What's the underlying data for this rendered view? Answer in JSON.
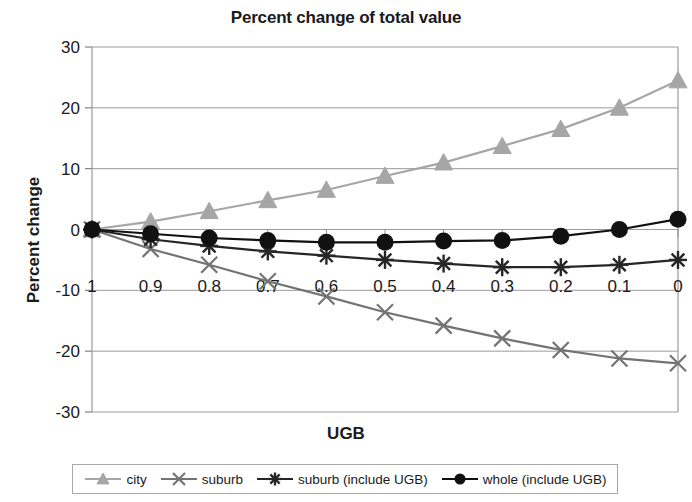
{
  "chart_data": {
    "type": "line",
    "title": "Percent change of total value",
    "xlabel": "UGB",
    "ylabel": "Percent change",
    "x": [
      1,
      0.9,
      0.8,
      0.7,
      0.6,
      0.5,
      0.4,
      0.3,
      0.2,
      0.1,
      0
    ],
    "xticklabels": [
      "1",
      "0.9",
      "0.8",
      "0.7",
      "0.6",
      "0.5",
      "0.4",
      "0.3",
      "0.2",
      "0.1",
      "0"
    ],
    "yticklabels": [
      "30",
      "20",
      "10",
      "0",
      "-10",
      "-20",
      "-30"
    ],
    "yticks": [
      30,
      20,
      10,
      0,
      -10,
      -20,
      -30
    ],
    "ylim": [
      -30,
      30
    ],
    "grid": true,
    "legend_position": "bottom",
    "series": [
      {
        "name": "city",
        "marker": "triangle",
        "color": "#a6a6a6",
        "values": [
          0,
          1.3,
          3.0,
          4.8,
          6.5,
          8.8,
          11.0,
          13.7,
          16.5,
          20.0,
          24.5
        ]
      },
      {
        "name": "suburb",
        "marker": "x",
        "color": "#737373",
        "values": [
          0,
          -3.2,
          -5.8,
          -8.5,
          -11.0,
          -13.6,
          -15.8,
          -17.9,
          -19.8,
          -21.2,
          -22.0
        ]
      },
      {
        "name": "suburb (include UGB)",
        "marker": "asterisk",
        "color": "#262626",
        "values": [
          0,
          -1.6,
          -2.7,
          -3.6,
          -4.3,
          -5.0,
          -5.6,
          -6.2,
          -6.2,
          -5.8,
          -5.0
        ]
      },
      {
        "name": "whole (include UGB)",
        "marker": "circle",
        "color": "#111111",
        "values": [
          0,
          -0.7,
          -1.4,
          -1.8,
          -2.1,
          -2.1,
          -1.9,
          -1.8,
          -1.1,
          0.0,
          1.7
        ]
      }
    ]
  },
  "legend": {
    "items": [
      {
        "label": "city"
      },
      {
        "label": "suburb"
      },
      {
        "label": "suburb (include UGB)"
      },
      {
        "label": "whole (include UGB)"
      }
    ]
  }
}
